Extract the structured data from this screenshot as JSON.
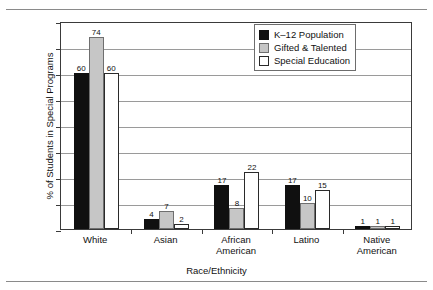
{
  "chart_data": {
    "type": "bar",
    "title": "",
    "xlabel": "Race/Ethnicity",
    "ylabel": "% of Students in Special Programs",
    "categories": [
      "White",
      "Asian",
      "African American",
      "Latino",
      "Native American"
    ],
    "series": [
      {
        "name": "K–12 Population",
        "color": "#101010",
        "values": [
          60,
          4,
          17,
          17,
          1
        ]
      },
      {
        "name": "Gifted & Talented",
        "color": "#c6c6c6",
        "values": [
          74,
          7,
          8,
          10,
          1
        ]
      },
      {
        "name": "Special Education",
        "color": "#ffffff",
        "values": [
          60,
          2,
          22,
          15,
          1
        ]
      }
    ],
    "ylim": [
      0,
      80
    ],
    "yticks": [
      0,
      10,
      20,
      30,
      40,
      50,
      60,
      70,
      80
    ],
    "ytick_labels": [
      "0",
      "10",
      "20",
      "30",
      "40",
      "50",
      "60",
      "70",
      "80"
    ],
    "grid": true,
    "legend_position": "top-right",
    "data_labels": true
  }
}
